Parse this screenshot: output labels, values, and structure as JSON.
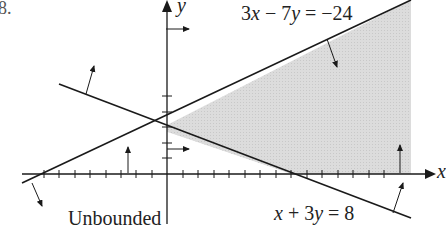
{
  "problem_number": "8.",
  "axes": {
    "x_label": "x",
    "y_label": "y"
  },
  "lines": [
    {
      "equation": "3x − 7y = −24",
      "parts": [
        "3",
        "x",
        " − 7",
        "y",
        " = −24"
      ]
    },
    {
      "equation": "x + 3y = 8",
      "parts": [
        "x",
        " + 3",
        "y",
        " = 8"
      ]
    }
  ],
  "region_label": "Unbounded",
  "colors": {
    "shade": "#d9d9d9",
    "ink": "#1a1a1a"
  }
}
